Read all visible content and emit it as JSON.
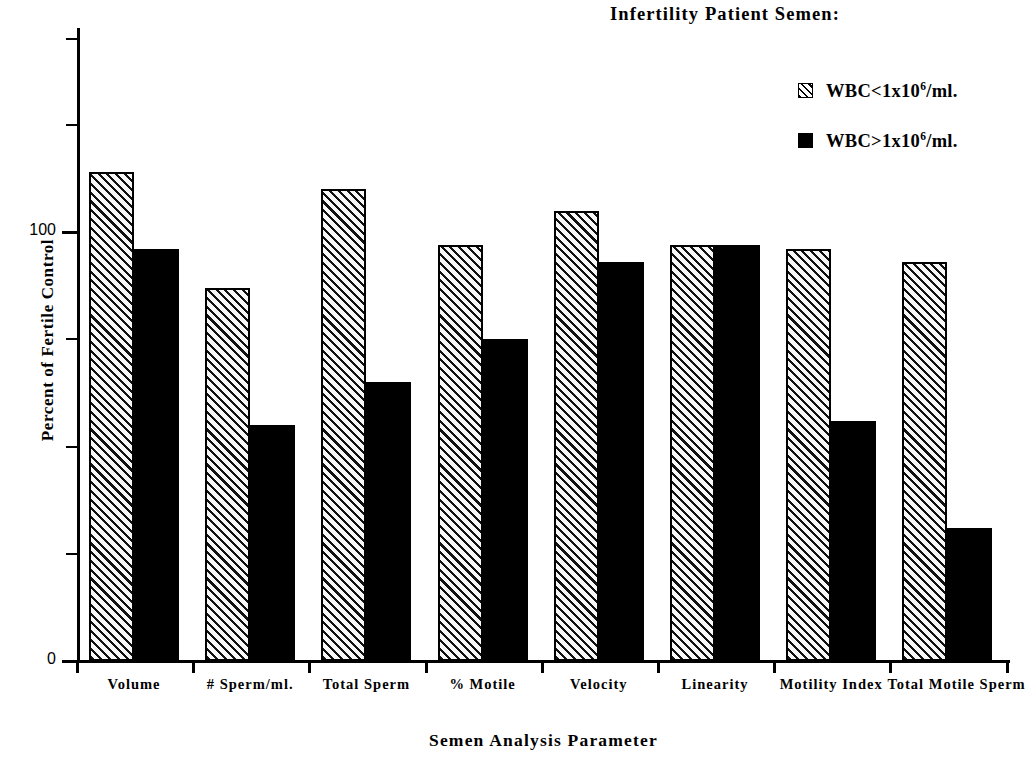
{
  "legend": {
    "title": "Infertility Patient Semen:",
    "entries": [
      {
        "label_pre": "WBC<1x10",
        "label_sup": "6",
        "label_post": "/ml.",
        "swatch": "hatched",
        "color": "#ffffff"
      },
      {
        "label_pre": "WBC>1x10",
        "label_sup": "6",
        "label_post": "/ml.",
        "swatch": "solid",
        "color": "#000000"
      }
    ]
  },
  "axes": {
    "y_title": "Percent of Fertile Control",
    "x_title": "Semen Analysis Parameter",
    "y_tick_labels": [
      "100",
      "0"
    ]
  },
  "chart_data": {
    "type": "bar",
    "title": "",
    "xlabel": "Semen Analysis Parameter",
    "ylabel": "Percent of Fertile Control",
    "ylim": [
      0,
      148
    ],
    "yticks": [
      0,
      25,
      50,
      75,
      100,
      125,
      145
    ],
    "ytick_labels_shown": {
      "0": "0",
      "100": "100"
    },
    "grid": false,
    "legend_position": "top-right",
    "legend_title": "Infertility Patient Semen:",
    "categories": [
      "Volume",
      "# Sperm/ml.",
      "Total Sperm",
      "% Motile",
      "Velocity",
      "Linearity",
      "Motility Index",
      "Total Motile Sperm"
    ],
    "series": [
      {
        "name": "WBC<1x10^6/ml.",
        "style": "hatched",
        "color": "#ffffff",
        "values": [
          114,
          87,
          110,
          97,
          105,
          97,
          96,
          93
        ]
      },
      {
        "name": "WBC>1x10^6/ml.",
        "style": "solid",
        "color": "#000000",
        "values": [
          96,
          55,
          65,
          75,
          93,
          97,
          56,
          31
        ]
      }
    ]
  }
}
